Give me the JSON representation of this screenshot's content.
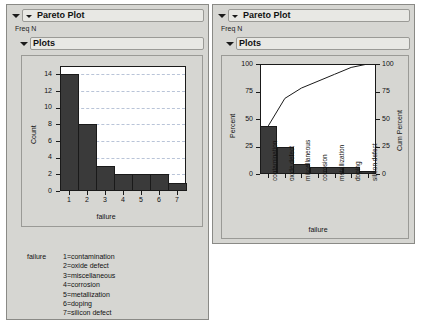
{
  "panels": [
    {
      "id": "left",
      "title": "Pareto Plot",
      "freq_label": "Freq N",
      "plots_label": "Plots"
    },
    {
      "id": "right",
      "title": "Pareto Plot",
      "freq_label": "Freq N",
      "plots_label": "Plots"
    }
  ],
  "legend": {
    "head": "failure",
    "items": [
      "1=contamination",
      "2=oxide defect",
      "3=miscellaneous",
      "4=corrosion",
      "5=metallization",
      "6=doping",
      "7=silicon defect"
    ]
  },
  "colors": {
    "bar_fill": "#3a3a3a",
    "bar_edge": "#1a1a1a",
    "panel_bg": "#d6d6d2",
    "plot_bg": "#ffffff",
    "gridline": "#b9c4d8"
  },
  "chart_data": [
    {
      "type": "bar",
      "id": "count-pareto",
      "title": "",
      "xlabel": "failure",
      "ylabel": "Count",
      "categories": [
        "1",
        "2",
        "3",
        "4",
        "5",
        "6",
        "7"
      ],
      "values": [
        14,
        8,
        3,
        2,
        2,
        2,
        1
      ],
      "ylim": [
        0,
        15
      ],
      "yticks": [
        0,
        2,
        4,
        6,
        8,
        10,
        12,
        14
      ],
      "xticks": [
        "1",
        "2",
        "3",
        "4",
        "5",
        "6",
        "7"
      ],
      "grid": true,
      "legend": "none"
    },
    {
      "type": "bar",
      "id": "percent-pareto",
      "title": "",
      "xlabel": "failure",
      "ylabel": "Percent",
      "y2label": "Cum Percent",
      "categories": [
        "contamination",
        "oxide defect",
        "miscellaneous",
        "corrosion",
        "metallization",
        "doping",
        "silicon defect"
      ],
      "values": [
        43.75,
        25.0,
        9.375,
        6.25,
        6.25,
        6.25,
        3.125
      ],
      "ylim": [
        0,
        100
      ],
      "yticks": [
        0,
        25,
        50,
        75,
        100
      ],
      "y2lim": [
        0,
        100
      ],
      "y2ticks": [
        0,
        25,
        50,
        75,
        100
      ],
      "grid": false,
      "legend": "none",
      "series": [
        {
          "name": "Cum Percent",
          "type": "line",
          "values": [
            43.75,
            68.75,
            78.125,
            84.375,
            90.625,
            96.875,
            100.0
          ]
        }
      ]
    }
  ]
}
